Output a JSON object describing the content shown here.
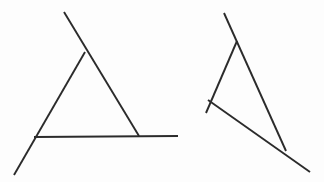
{
  "canvas": {
    "width": 324,
    "height": 182,
    "background_color": "#fdfdfd",
    "stroke_color": "#2b2b2b",
    "stroke_width": 1.9
  },
  "figures": [
    {
      "id": "left-triangle-figure",
      "name": "upright-triangle-with-overshooting-strokes",
      "description": "Triangle drawn with three straight pencil strokes whose ends overshoot the corners",
      "strokes": [
        {
          "id": "left-stroke-right-side",
          "name": "right-side-stroke",
          "x1": 64,
          "y1": 12,
          "x2": 139,
          "y2": 136
        },
        {
          "id": "left-stroke-left-side",
          "name": "left-side-stroke",
          "x1": 85,
          "y1": 52,
          "x2": 14,
          "y2": 175
        },
        {
          "id": "left-stroke-base",
          "name": "base-stroke",
          "x1": 34,
          "y1": 137,
          "x2": 178,
          "y2": 136
        }
      ],
      "vertices": [
        {
          "id": "left-apex",
          "name": "apex-vertex",
          "x": 85,
          "y": 52
        },
        {
          "id": "left-bottom-left",
          "name": "bottom-left-vertex",
          "x": 34,
          "y": 137
        },
        {
          "id": "left-bottom-right",
          "name": "bottom-right-vertex",
          "x": 139,
          "y": 136
        }
      ]
    },
    {
      "id": "right-triangle-figure",
      "name": "rotated-triangle-with-overshooting-strokes",
      "description": "Same triangle rotated clockwise, drawn with three straight pencil strokes whose ends overshoot the corners",
      "strokes": [
        {
          "id": "right-stroke-long-side",
          "name": "long-side-stroke",
          "x1": 224,
          "y1": 13,
          "x2": 286,
          "y2": 151
        },
        {
          "id": "right-stroke-left-side",
          "name": "left-side-stroke",
          "x1": 237,
          "y1": 41,
          "x2": 206,
          "y2": 113
        },
        {
          "id": "right-stroke-base",
          "name": "base-stroke",
          "x1": 208,
          "y1": 100,
          "x2": 310,
          "y2": 172
        }
      ],
      "vertices": [
        {
          "id": "right-apex",
          "name": "apex-vertex",
          "x": 237,
          "y": 41
        },
        {
          "id": "right-left",
          "name": "left-vertex",
          "x": 208,
          "y": 100
        },
        {
          "id": "right-bottom",
          "name": "bottom-vertex",
          "x": 286,
          "y": 151
        }
      ]
    }
  ]
}
